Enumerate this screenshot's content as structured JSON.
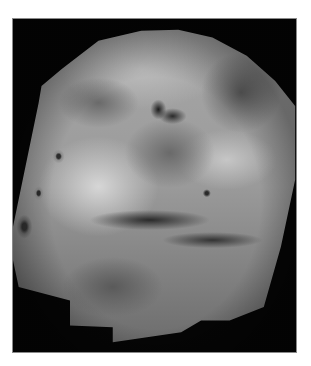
{
  "image": {
    "subject": "Grayscale mosaic of the planet Mars showing Valles Marineris canyon system and Tharsis volcanoes",
    "frame_color": "#050505",
    "background_color": "#ffffff",
    "features": [
      "valles-marineris-canyon",
      "tharsis-volcanoes",
      "chasma-dark-patches"
    ]
  }
}
